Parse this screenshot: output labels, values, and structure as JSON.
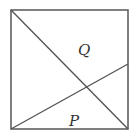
{
  "diagram": {
    "square": {
      "x1": 11,
      "y1": 10,
      "x2": 128,
      "y2": 129,
      "stroke": "#555555"
    },
    "lines": [
      {
        "name": "diagonal",
        "from": [
          11,
          10
        ],
        "to": [
          128,
          129
        ]
      },
      {
        "name": "slanted-line",
        "from": [
          11,
          129
        ],
        "to": [
          128,
          64
        ]
      }
    ],
    "labels": {
      "q": {
        "text": "Q",
        "x": 78,
        "y": 55
      },
      "p": {
        "text": "P",
        "x": 69,
        "y": 126
      }
    }
  }
}
